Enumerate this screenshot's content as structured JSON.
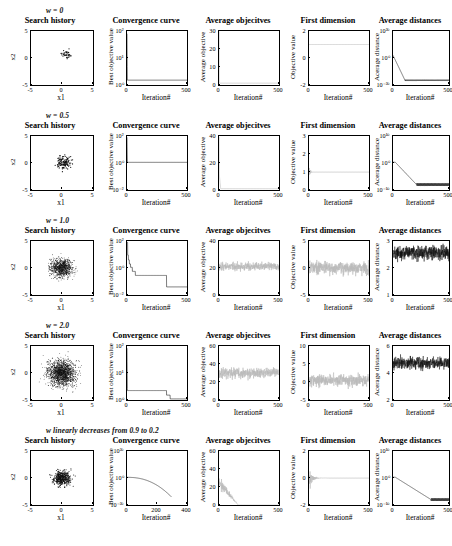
{
  "figure": {
    "panel_titles": {
      "search": "Search history",
      "convergence": "Convergence curve",
      "avg_obj": "Average objecitves",
      "first_dim": "First dimension",
      "avg_dist": "Average distances"
    },
    "axis_labels": {
      "x1": "x1",
      "x2": "x2",
      "iteration": "Iteration#",
      "best_objective_value": "Best objective value",
      "average_objective": "Average objective",
      "objective_value": "Objective value",
      "average_distance": "Acerage distance",
      "average_distance_alt": "Average distance"
    }
  },
  "rows": [
    {
      "label": "w = 0",
      "charts": [
        {
          "type": "scatter",
          "title": "Search history",
          "xlabel": "x1",
          "ylabel": "x2",
          "xlim": [
            -5,
            5
          ],
          "ylim": [
            -5,
            5
          ],
          "xticks": [
            "-5",
            "0",
            "5"
          ],
          "yticks": [
            "5",
            "0",
            "-5"
          ],
          "n_points": 35,
          "spread": 0.9,
          "center": [
            0.6,
            0.6
          ],
          "cluster": "tight"
        },
        {
          "type": "line",
          "title": "Convergence curve",
          "xlabel": "Iteration#",
          "ylabel": "Best objective value",
          "xlim": [
            0,
            500
          ],
          "ylim_log": [
            0,
            2
          ],
          "xticks": [
            "0",
            "500"
          ],
          "yticks": [
            "10²",
            "10¹",
            "10⁰"
          ],
          "shape": "instant-drop",
          "final_level": 0.18
        },
        {
          "type": "line",
          "title": "Average objecitves",
          "xlabel": "Iteration#",
          "ylabel": "Average objective",
          "xlim": [
            0,
            500
          ],
          "ylim": [
            0,
            30
          ],
          "xticks": [
            "0",
            "500"
          ],
          "yticks": [
            "30",
            "20",
            "10",
            "0"
          ],
          "shape": "flat-low",
          "final_level": 1.0
        },
        {
          "type": "line",
          "title": "First dimension",
          "xlabel": "Iteration#",
          "ylabel": "Objective value",
          "xlim": [
            0,
            500
          ],
          "ylim": [
            -2,
            2
          ],
          "xticks": [
            "0",
            "500"
          ],
          "yticks": [
            "2",
            "0",
            "-2"
          ],
          "shape": "flat-const",
          "const_value": 1.0
        },
        {
          "type": "line",
          "title": "Average distances",
          "xlabel": "Iteration#",
          "ylabel": "Acerage distance",
          "xlim": [
            0,
            500
          ],
          "ylim_log": [
            -20,
            20
          ],
          "xticks": [
            "0",
            "500"
          ],
          "yticks": [
            "10²⁰",
            "10⁰",
            "10⁻²⁰"
          ],
          "shape": "decay-floor",
          "floor": -17,
          "start": 2
        }
      ]
    },
    {
      "label": "w = 0.5",
      "charts": [
        {
          "type": "scatter",
          "title": "Search history",
          "xlabel": "x1",
          "ylabel": "x2",
          "xlim": [
            -5,
            5
          ],
          "ylim": [
            -5,
            5
          ],
          "xticks": [
            "-5",
            "0",
            "5"
          ],
          "yticks": [
            "5",
            "0",
            "-5"
          ],
          "n_points": 120,
          "spread": 1.3,
          "center": [
            0.4,
            0.0
          ],
          "cluster": "tight"
        },
        {
          "type": "line",
          "title": "Convergence curve",
          "xlabel": "Iteration#",
          "ylabel": "Best objective value",
          "xlim": [
            0,
            500
          ],
          "ylim_log": [
            -2,
            2
          ],
          "xticks": [
            "0",
            "500"
          ],
          "yticks": [
            "10²",
            "10⁰",
            "10⁻²"
          ],
          "shape": "instant-drop",
          "final_level": 0.05
        },
        {
          "type": "line",
          "title": "Average objecitves",
          "xlabel": "Iteration#",
          "ylabel": "Average objective",
          "xlim": [
            0,
            500
          ],
          "ylim": [
            0,
            40
          ],
          "xticks": [
            "0",
            "500"
          ],
          "yticks": [
            "40",
            "20",
            "0"
          ],
          "shape": "spike-then-flat",
          "final_level": 1.0
        },
        {
          "type": "line",
          "title": "First dimension",
          "xlabel": "Iteration#",
          "ylabel": "Objective value",
          "xlim": [
            0,
            500
          ],
          "ylim": [
            0,
            3
          ],
          "xticks": [
            "0",
            "500"
          ],
          "yticks": [
            "3",
            "2",
            "1",
            "0"
          ],
          "shape": "flat-const-noisy-start",
          "const_value": 1.0
        },
        {
          "type": "line",
          "title": "Average distances",
          "xlabel": "Iteration#",
          "ylabel": "Acerage distance",
          "xlim": [
            0,
            500
          ],
          "ylim_log": [
            -10,
            10
          ],
          "xticks": [
            "0",
            "500"
          ],
          "yticks": [
            "10¹⁰",
            "10⁰",
            "10⁻¹⁰"
          ],
          "shape": "slope-floor",
          "floor": -8,
          "start": 0.3,
          "knee": 0.42
        }
      ]
    },
    {
      "label": "w = 1.0",
      "charts": [
        {
          "type": "scatter",
          "title": "Search history",
          "xlabel": "x1",
          "ylabel": "x2",
          "xlim": [
            -5,
            5
          ],
          "ylim": [
            -5,
            5
          ],
          "xticks": [
            "-5",
            "0",
            "5"
          ],
          "yticks": [
            "5",
            "0",
            "-5"
          ],
          "n_points": 900,
          "spread": 2.0,
          "center": [
            0.0,
            0.0
          ],
          "cluster": "broad"
        },
        {
          "type": "line",
          "title": "Convergence curve",
          "xlabel": "Iteration#",
          "ylabel": "Best objective value",
          "xlim": [
            0,
            500
          ],
          "ylim_log": [
            -2,
            2
          ],
          "xticks": [
            "0",
            "500"
          ],
          "yticks": [
            "10²",
            "10⁰",
            "10⁻²"
          ],
          "shape": "staircase",
          "final_level": -1.4
        },
        {
          "type": "line",
          "title": "Average objecitves",
          "xlabel": "Iteration#",
          "ylabel": "Average objective",
          "xlim": [
            0,
            500
          ],
          "ylim": [
            0,
            40
          ],
          "xticks": [
            "0",
            "500"
          ],
          "yticks": [
            "40",
            "20",
            "0"
          ],
          "shape": "noisy-band",
          "mean": 21,
          "amp": 6
        },
        {
          "type": "line",
          "title": "First dimension",
          "xlabel": "Iteration#",
          "ylabel": "Objective value",
          "xlim": [
            0,
            500
          ],
          "ylim": [
            -5,
            5
          ],
          "xticks": [
            "0",
            "500"
          ],
          "yticks": [
            "5",
            "0",
            "-5"
          ],
          "shape": "noisy-band",
          "mean": 0,
          "amp": 2.4
        },
        {
          "type": "line",
          "title": "Average distances",
          "xlabel": "Iteration#",
          "ylabel": "Acerage distance",
          "xlim": [
            0,
            500
          ],
          "ylim": [
            0,
            3
          ],
          "xticks": [
            "0",
            "500"
          ],
          "yticks": [
            "3",
            "2",
            "1"
          ],
          "shape": "noisy-dense",
          "mean": 2.35,
          "amp": 0.75
        }
      ]
    },
    {
      "label": "w = 2.0",
      "charts": [
        {
          "type": "scatter",
          "title": "Search history",
          "xlabel": "x1",
          "ylabel": "x2",
          "xlim": [
            -5,
            5
          ],
          "ylim": [
            -5,
            5
          ],
          "xticks": [
            "-5",
            "0",
            "5"
          ],
          "yticks": [
            "5",
            "0",
            "-5"
          ],
          "n_points": 1600,
          "spread": 2.6,
          "center": [
            0.0,
            0.0
          ],
          "cluster": "broad"
        },
        {
          "type": "line",
          "title": "Convergence curve",
          "xlabel": "Iteration#",
          "ylabel": "Best objective value",
          "xlim": [
            0,
            500
          ],
          "ylim_log": [
            0,
            2
          ],
          "xticks": [
            "0",
            "500"
          ],
          "yticks": [
            "10²",
            "10¹",
            "10⁰"
          ],
          "shape": "drop-then-step",
          "final_level": 0.04
        },
        {
          "type": "line",
          "title": "Average objecitves",
          "xlabel": "Iteration#",
          "ylabel": "Average objective",
          "xlim": [
            0,
            500
          ],
          "ylim": [
            0,
            60
          ],
          "xticks": [
            "0",
            "500"
          ],
          "yticks": [
            "60",
            "40",
            "20",
            "0"
          ],
          "shape": "noisy-band",
          "mean": 30,
          "amp": 11
        },
        {
          "type": "line",
          "title": "First dimension",
          "xlabel": "Iteration#",
          "ylabel": "Objective value",
          "xlim": [
            0,
            500
          ],
          "ylim": [
            -5,
            10
          ],
          "xticks": [
            "0",
            "500"
          ],
          "yticks": [
            "10",
            "5",
            "0",
            "-5"
          ],
          "shape": "noisy-band",
          "mean": 0.5,
          "amp": 3.2
        },
        {
          "type": "line",
          "title": "Average distances",
          "xlabel": "Iteration#",
          "ylabel": "Acerage distance",
          "xlim": [
            0,
            500
          ],
          "ylim": [
            0,
            6
          ],
          "xticks": [
            "0",
            "500"
          ],
          "yticks": [
            "6",
            "4",
            "2"
          ],
          "shape": "noisy-dense",
          "mean": 4.1,
          "amp": 1.3
        }
      ]
    },
    {
      "label": "w linearly decreases from 0.9 to 0.2",
      "charts": [
        {
          "type": "scatter",
          "title": "Search history",
          "xlabel": "x1",
          "ylabel": "x2",
          "xlim": [
            -5,
            5
          ],
          "ylim": [
            -5,
            5
          ],
          "xticks": [
            "-5",
            "0",
            "5"
          ],
          "yticks": [
            "5",
            "0",
            "-5"
          ],
          "n_points": 450,
          "spread": 1.5,
          "center": [
            0.0,
            0.0
          ],
          "cluster": "medium"
        },
        {
          "type": "line",
          "title": "Convergence curve",
          "xlabel": "Iteration#",
          "ylabel": "Best objective value",
          "xlim": [
            0,
            400
          ],
          "ylim_log": [
            -20,
            20
          ],
          "xticks": [
            "0",
            "200",
            "400"
          ],
          "yticks": [
            "10²⁰",
            "10⁰",
            "10⁻²⁰"
          ],
          "shape": "smooth-decay",
          "start": 0.5,
          "end": -14
        },
        {
          "type": "line",
          "title": "Average objecitves",
          "xlabel": "Iteration#",
          "ylabel": "Average objective",
          "xlim": [
            0,
            500
          ],
          "ylim": [
            0,
            60
          ],
          "xticks": [
            "0",
            "500"
          ],
          "yticks": [
            "60",
            "40",
            "20",
            "0"
          ],
          "shape": "funnel-collapse",
          "mean": 26,
          "amp": 14
        },
        {
          "type": "line",
          "title": "First dimension",
          "xlabel": "Iteration#",
          "ylabel": "Objective value",
          "xlim": [
            0,
            500
          ],
          "ylim": [
            -2,
            2
          ],
          "xticks": [
            "0",
            "500"
          ],
          "yticks": [
            "2",
            "0",
            "-2"
          ],
          "shape": "damped",
          "mean": 0,
          "amp": 1.1
        },
        {
          "type": "line",
          "title": "Average distances",
          "xlabel": "Iteration#",
          "ylabel": "Acerage distance",
          "xlim": [
            0,
            500
          ],
          "ylim_log": [
            -10,
            10
          ],
          "xticks": [
            "0",
            "500"
          ],
          "yticks": [
            "10¹⁰",
            "10⁰",
            "10⁻¹⁰"
          ],
          "shape": "slope-floor",
          "floor": -8,
          "start": 0.3,
          "knee": 0.68
        }
      ]
    }
  ]
}
